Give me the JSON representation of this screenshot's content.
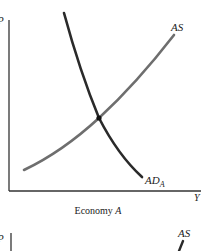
{
  "panel_a": {
    "y_axis_label": "P",
    "x_axis_label": "Y",
    "as_label": "AS",
    "ad_label": "AD",
    "ad_subscript": "A",
    "caption_prefix": "Economy ",
    "caption_italic": "A"
  },
  "panel_b": {
    "y_axis_label": "P",
    "as_label": "AS"
  },
  "colors": {
    "axis": "#333333",
    "ad_curve": "#2a2a2a",
    "as_curve": "#6e6e6e",
    "equilibrium_point": "#111111"
  }
}
